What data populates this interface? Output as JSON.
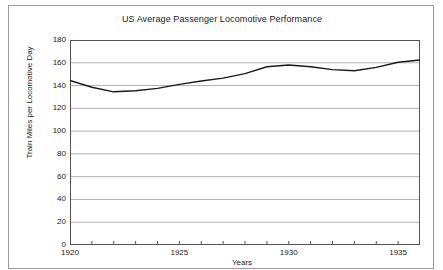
{
  "chart_data": {
    "type": "line",
    "title": "US Average Passenger Locomotive Performance",
    "xlabel": "Years",
    "ylabel": "Train Miles per Locomotive Day",
    "xlim": [
      1920,
      1936
    ],
    "ylim": [
      0,
      180
    ],
    "y_ticks": [
      0,
      20,
      40,
      60,
      80,
      100,
      120,
      140,
      160,
      180
    ],
    "x_ticks": [
      1920,
      1925,
      1930,
      1935
    ],
    "x_tick_labels": [
      "1920",
      "1925",
      "1930",
      "1935"
    ],
    "y_tick_labels": [
      "0",
      "20",
      "40",
      "60",
      "80",
      "100",
      "120",
      "140",
      "160",
      "180"
    ],
    "grid": "horizontal",
    "legend": "none",
    "line_color": "#1a1a1a",
    "grid_color": "#b0b0b0",
    "axis_color": "#555555",
    "background_color": "#ffffff",
    "x": [
      1920,
      1921,
      1922,
      1923,
      1924,
      1925,
      1926,
      1927,
      1928,
      1929,
      1930,
      1931,
      1932,
      1933,
      1934,
      1935,
      1936
    ],
    "values": [
      144.5,
      138.5,
      134.5,
      135.5,
      137.5,
      141.0,
      144.0,
      146.5,
      150.5,
      156.5,
      158.0,
      156.5,
      154.0,
      153.0,
      156.0,
      160.5,
      162.5
    ],
    "series": [
      {
        "name": "Train Miles per Locomotive Day",
        "values": [
          144.5,
          138.5,
          134.5,
          135.5,
          137.5,
          141.0,
          144.0,
          146.5,
          150.5,
          156.5,
          158.0,
          156.5,
          154.0,
          153.0,
          156.0,
          160.5,
          162.5
        ]
      }
    ]
  }
}
